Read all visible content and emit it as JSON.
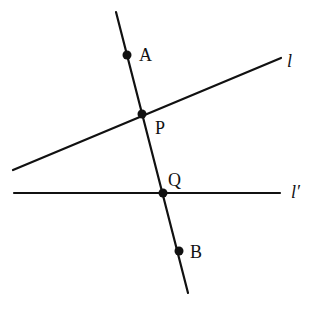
{
  "diagram": {
    "colors": {
      "stroke": "#111111",
      "background": "#ffffff"
    },
    "lines": [
      {
        "id": "transversal",
        "x1": 116,
        "y1": 12,
        "x2": 188,
        "y2": 293
      },
      {
        "id": "l",
        "x1": 13,
        "y1": 170,
        "x2": 281,
        "y2": 58
      },
      {
        "id": "l_prime",
        "x1": 14,
        "y1": 193,
        "x2": 280,
        "y2": 193
      }
    ],
    "points": [
      {
        "id": "A",
        "x": 127,
        "y": 55
      },
      {
        "id": "P",
        "x": 142,
        "y": 114
      },
      {
        "id": "Q",
        "x": 163,
        "y": 193
      },
      {
        "id": "B",
        "x": 179,
        "y": 251
      }
    ],
    "labels": {
      "A": {
        "text": "A",
        "x": 139,
        "y": 61
      },
      "P": {
        "text": "P",
        "x": 155,
        "y": 134
      },
      "Q": {
        "text": "Q",
        "x": 168,
        "y": 186
      },
      "B": {
        "text": "B",
        "x": 190,
        "y": 258
      },
      "l": {
        "text": "l",
        "x": 287,
        "y": 67
      },
      "l_prime": {
        "text": "l′",
        "x": 291,
        "y": 198
      }
    }
  }
}
